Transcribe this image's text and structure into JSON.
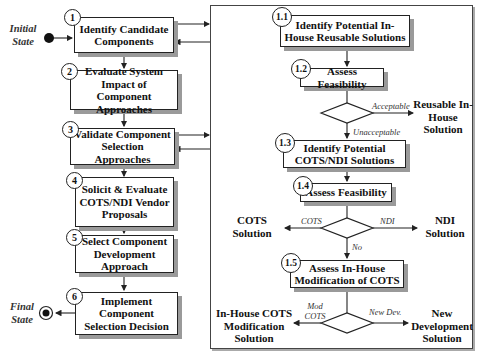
{
  "states": {
    "initial": "Initial State",
    "final": "Final State"
  },
  "main_steps": [
    {
      "num": "1",
      "label": "Identify Candidate Components"
    },
    {
      "num": "2",
      "label": "Evaluate System Impact of Component Approaches"
    },
    {
      "num": "3",
      "label": "Validate Component Selection Approaches"
    },
    {
      "num": "4",
      "label": "Solicit & Evaluate COTS/NDI Vendor Proposals"
    },
    {
      "num": "5",
      "label": "Select Component Development Approach"
    },
    {
      "num": "6",
      "label": "Implement Component Selection Decision"
    }
  ],
  "sub_steps": [
    {
      "num": "1.1",
      "label": "Identify Potential In-House Reusable Solutions"
    },
    {
      "num": "1.2",
      "label": "Assess Feasibility"
    },
    {
      "num": "1.3",
      "label": "Identify Potential COTS/NDI Solutions"
    },
    {
      "num": "1.4",
      "label": "Assess Feasibility"
    },
    {
      "num": "1.5",
      "label": "Assess In-House Modification of COTS"
    }
  ],
  "decisions": {
    "d1": {
      "accept": "Acceptable",
      "reject": "Unacceptable"
    },
    "d2": {
      "left": "COTS",
      "right": "NDI",
      "down": "No"
    },
    "d3": {
      "left": "Mod COTS",
      "right": "New Dev."
    }
  },
  "outcomes": {
    "reusable": "Reusable In-House Solution",
    "cots": "COTS Solution",
    "ndi": "NDI Solution",
    "mod_cots": "In-House COTS Modification Solution",
    "new_dev": "New Development Solution"
  }
}
